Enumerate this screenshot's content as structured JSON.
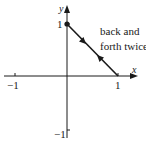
{
  "diagram": {
    "axes": {
      "x_label": "x",
      "y_label": "y",
      "x_ticks": [
        {
          "value": -1,
          "label": "−1"
        },
        {
          "value": 1,
          "label": "1"
        }
      ],
      "y_ticks": [
        {
          "value": 1,
          "label": "1"
        },
        {
          "value": -1,
          "label": "−1"
        }
      ]
    },
    "path": {
      "from": [
        0,
        1
      ],
      "to": [
        1,
        0
      ],
      "start_point_marker": "filled-dot",
      "direction_arrows": [
        "toward (1,0)",
        "toward (0,1)"
      ]
    },
    "annotation": {
      "line1": "back and",
      "line2": "forth twice"
    },
    "colors": {
      "ink": "#1a1a1a",
      "background": "#ffffff"
    }
  }
}
